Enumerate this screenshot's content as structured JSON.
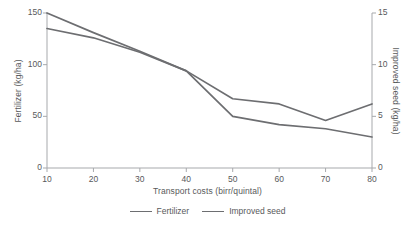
{
  "chart_data": {
    "type": "line",
    "title": "",
    "xlabel": "Transport costs (birr/quintal)",
    "ylabel": "Fertilizer (kg/ha)",
    "y2label": "Improved seed (kg/ha)",
    "x": [
      10,
      20,
      30,
      40,
      50,
      60,
      70,
      80
    ],
    "xlim": [
      10,
      80
    ],
    "xticks": [
      10,
      20,
      30,
      40,
      50,
      60,
      70,
      80
    ],
    "xticklabels": [
      "10",
      "20",
      "30",
      "40",
      "50",
      "60",
      "70",
      "80"
    ],
    "ylim": [
      0,
      150
    ],
    "yticks": [
      0,
      50,
      100,
      150
    ],
    "yticklabels": [
      "0",
      "50",
      "100",
      "150"
    ],
    "y2lim": [
      0,
      15
    ],
    "y2ticks": [
      0,
      5,
      10,
      15
    ],
    "y2ticklabels": [
      "0",
      "5",
      "10",
      "15"
    ],
    "grid": false,
    "legend_position": "bottom",
    "series": [
      {
        "name": "Fertilizer",
        "axis": "left",
        "units": "kg/ha",
        "color": "#6d6e71",
        "values": [
          150,
          131,
          113,
          94,
          50,
          42,
          38,
          30
        ]
      },
      {
        "name": "Improved seed",
        "axis": "right",
        "units": "kg/ha",
        "color": "#6d6e71",
        "values": [
          13.5,
          12.6,
          11.2,
          9.4,
          6.7,
          6.2,
          4.6,
          6.2
        ]
      }
    ]
  },
  "legend": {
    "items": [
      {
        "label": "Fertilizer"
      },
      {
        "label": "Improved seed"
      }
    ]
  }
}
